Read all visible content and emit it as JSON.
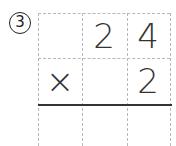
{
  "problem": {
    "number_label": "3",
    "rows": [
      [
        "",
        "2",
        "4"
      ],
      [
        "×",
        "",
        "2"
      ],
      [
        "",
        "",
        ""
      ]
    ]
  },
  "colors": {
    "grid_line": "#b8b8b8",
    "rule_line": "#333333",
    "digit": "#333333"
  }
}
